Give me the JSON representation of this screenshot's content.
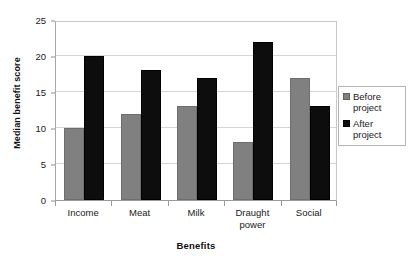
{
  "chart_data": {
    "type": "bar",
    "title": "",
    "xlabel": "Benefits",
    "ylabel": "Median benefit score",
    "categories": [
      "Income",
      "Meat",
      "Milk",
      "Draught power",
      "Social"
    ],
    "category_display": [
      "Income",
      "Meat",
      "Milk",
      "Draught\npower",
      "Social"
    ],
    "series": [
      {
        "name": "Before project",
        "label": "Before\nproject",
        "color": "#808080",
        "values": [
          10,
          12,
          13,
          8,
          17
        ]
      },
      {
        "name": "After project",
        "label": "After\nproject",
        "color": "#0d0d0d",
        "values": [
          20,
          18,
          17,
          22,
          13
        ]
      }
    ],
    "ylim": [
      0,
      25
    ],
    "yticks": [
      0,
      5,
      10,
      15,
      20,
      25
    ],
    "ytick_labels": [
      "0",
      "5",
      "10",
      "15",
      "20",
      "25"
    ],
    "grid": true,
    "grid_axis": "y",
    "legend_position": "right",
    "legend_border_color": "#b5b5b5",
    "plot_border_color": "#a8a8a8",
    "gridline_color": "#d4d4d4",
    "background_color": "#ffffff"
  }
}
